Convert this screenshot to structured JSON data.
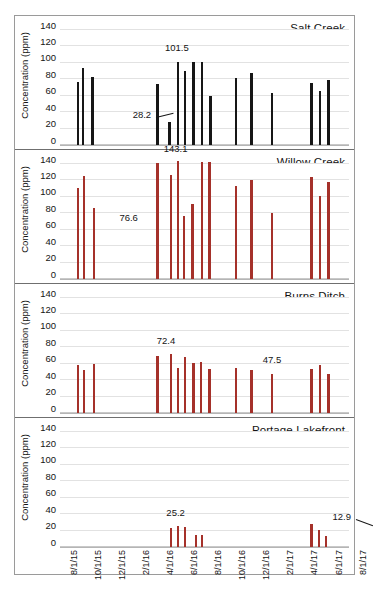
{
  "chart_data": {
    "type": "bar",
    "title": "",
    "ylabel": "Concentration (ppm)",
    "xlabel": "",
    "ylim": [
      0,
      140
    ],
    "yticks": [
      0,
      20,
      40,
      60,
      80,
      100,
      120,
      140
    ],
    "grid": true,
    "legend": "none",
    "x_tick_labels": [
      "8/1/15",
      "10/1/15",
      "12/1/15",
      "2/1/16",
      "4/1/16",
      "6/1/16",
      "8/1/16",
      "10/1/16",
      "12/1/16",
      "2/1/17",
      "4/1/17",
      "6/1/17",
      "8/1/17"
    ],
    "panels": [
      {
        "name": "Salt Creek",
        "bar_color": "#161616",
        "points": [
          {
            "x": 7.0,
            "y": 77.0
          },
          {
            "x": 9.0,
            "y": 93.5
          },
          {
            "x": 13.0,
            "y": 82.5
          },
          {
            "x": 40.0,
            "y": 74.5
          },
          {
            "x": 45.0,
            "y": 28.2
          },
          {
            "x": 48.5,
            "y": 101.5
          },
          {
            "x": 51.5,
            "y": 89.5
          },
          {
            "x": 55.0,
            "y": 100.5
          },
          {
            "x": 58.5,
            "y": 101.5
          },
          {
            "x": 62.0,
            "y": 59.5
          },
          {
            "x": 72.5,
            "y": 81.5
          },
          {
            "x": 79.0,
            "y": 88.0
          },
          {
            "x": 87.5,
            "y": 63.0
          },
          {
            "x": 104.0,
            "y": 75.5
          },
          {
            "x": 107.5,
            "y": 65.5
          },
          {
            "x": 111.0,
            "y": 79.5
          }
        ],
        "annotations": [
          {
            "text": "101.5",
            "x": 48.5,
            "y": 112.0,
            "leader": false
          },
          {
            "text": "28.2",
            "x": 34.0,
            "y": 30.0,
            "leader": true
          }
        ]
      },
      {
        "name": "Willow Creek",
        "bar_color": "#a5312a",
        "points": [
          {
            "x": 7.0,
            "y": 110.5
          },
          {
            "x": 9.5,
            "y": 125.0
          },
          {
            "x": 13.5,
            "y": 86.0
          },
          {
            "x": 40.0,
            "y": 141.5
          },
          {
            "x": 45.5,
            "y": 126.5
          },
          {
            "x": 48.5,
            "y": 143.1
          },
          {
            "x": 51.0,
            "y": 77.0
          },
          {
            "x": 54.5,
            "y": 91.0
          },
          {
            "x": 58.5,
            "y": 142.5
          },
          {
            "x": 61.5,
            "y": 142.5
          },
          {
            "x": 72.5,
            "y": 113.5
          },
          {
            "x": 79.0,
            "y": 120.5
          },
          {
            "x": 87.5,
            "y": 80.5
          },
          {
            "x": 104.0,
            "y": 124.0
          },
          {
            "x": 107.5,
            "y": 101.5
          },
          {
            "x": 111.0,
            "y": 117.5
          }
        ],
        "annotations": [
          {
            "text": "143.1",
            "x": 48.0,
            "y": 152.0,
            "leader": false
          },
          {
            "text": "76.6",
            "x": 28.5,
            "y": 68.0,
            "leader": false
          }
        ]
      },
      {
        "name": "Burns Ditch",
        "bar_color": "#a5312a",
        "points": [
          {
            "x": 7.0,
            "y": 59.0
          },
          {
            "x": 9.5,
            "y": 52.0
          },
          {
            "x": 13.5,
            "y": 59.5
          },
          {
            "x": 40.0,
            "y": 70.0
          },
          {
            "x": 45.5,
            "y": 72.4
          },
          {
            "x": 48.5,
            "y": 55.0
          },
          {
            "x": 51.5,
            "y": 68.0
          },
          {
            "x": 55.0,
            "y": 60.5
          },
          {
            "x": 58.0,
            "y": 61.5
          },
          {
            "x": 61.5,
            "y": 53.5
          },
          {
            "x": 72.5,
            "y": 54.5
          },
          {
            "x": 79.0,
            "y": 52.0
          },
          {
            "x": 87.5,
            "y": 47.5
          },
          {
            "x": 104.0,
            "y": 53.5
          },
          {
            "x": 107.5,
            "y": 58.0
          },
          {
            "x": 111.0,
            "y": 47.0
          }
        ],
        "annotations": [
          {
            "text": "72.4",
            "x": 44.0,
            "y": 82.0,
            "leader": false
          },
          {
            "text": "47.5",
            "x": 88.0,
            "y": 58.0,
            "leader": false
          }
        ]
      },
      {
        "name": "Portage Lakefront",
        "bar_color": "#a5312a",
        "points": [
          {
            "x": 45.5,
            "y": 23.0
          },
          {
            "x": 48.5,
            "y": 25.2
          },
          {
            "x": 51.5,
            "y": 24.5
          },
          {
            "x": 56.0,
            "y": 15.0
          },
          {
            "x": 58.5,
            "y": 15.0
          },
          {
            "x": 104.0,
            "y": 27.5
          },
          {
            "x": 107.0,
            "y": 21.0
          },
          {
            "x": 110.0,
            "y": 12.9
          }
        ],
        "annotations": [
          {
            "text": "25.2",
            "x": 48.0,
            "y": 35.0,
            "leader": false
          },
          {
            "text": "12.9",
            "x": 117.0,
            "y": 30.0,
            "leader": true
          }
        ]
      }
    ]
  }
}
